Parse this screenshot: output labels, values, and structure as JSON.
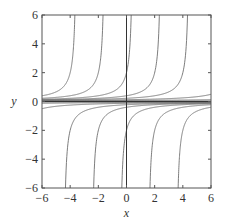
{
  "chart_data": {
    "type": "line",
    "title": "",
    "xlabel": "x",
    "ylabel": "y",
    "xlim": [
      -6,
      6
    ],
    "ylim": [
      -6,
      6
    ],
    "xticks": [
      -6,
      -4,
      -2,
      0,
      2,
      4,
      6
    ],
    "yticks": [
      -6,
      -4,
      -2,
      0,
      2,
      4,
      6
    ],
    "xtick_labels": [
      "−6",
      "−4",
      "−2",
      "0",
      "2",
      "4",
      "6"
    ],
    "ytick_labels": [
      "−6",
      "−4",
      "−2",
      "0",
      "2",
      "4",
      "6"
    ],
    "grid": false,
    "legend": null,
    "reference_lines": {
      "x0_vertical": true,
      "y0_horizontal": true
    },
    "family": "y = 1/(C - x)",
    "series": [
      {
        "name": "upper C=-3.5",
        "C": -3.5,
        "branch": "upper"
      },
      {
        "name": "upper C=-1.5",
        "C": -1.5,
        "branch": "upper"
      },
      {
        "name": "upper C=0.5",
        "C": 0.5,
        "branch": "upper"
      },
      {
        "name": "upper C=2.5",
        "C": 2.5,
        "branch": "upper"
      },
      {
        "name": "upper C=4.5",
        "C": 4.5,
        "branch": "upper"
      },
      {
        "name": "upper C=8",
        "C": 8,
        "branch": "upper"
      },
      {
        "name": "upper C=14",
        "C": 14,
        "branch": "upper"
      },
      {
        "name": "upper C=30",
        "C": 30,
        "branch": "upper"
      },
      {
        "name": "lower C=-4.5",
        "C": -4.5,
        "branch": "lower"
      },
      {
        "name": "lower C=-2.5",
        "C": -2.5,
        "branch": "lower"
      },
      {
        "name": "lower C=-0.5",
        "C": -0.5,
        "branch": "lower"
      },
      {
        "name": "lower C=1.5",
        "C": 1.5,
        "branch": "lower"
      },
      {
        "name": "lower C=3.5",
        "C": 3.5,
        "branch": "lower"
      },
      {
        "name": "lower C=-8",
        "C": -8,
        "branch": "lower"
      },
      {
        "name": "lower C=-14",
        "C": -14,
        "branch": "lower"
      },
      {
        "name": "lower C=-30",
        "C": -30,
        "branch": "lower"
      }
    ],
    "colors": {
      "curve": "#6e6e6e",
      "frame": "#555555",
      "axis_line": "#333333"
    }
  }
}
